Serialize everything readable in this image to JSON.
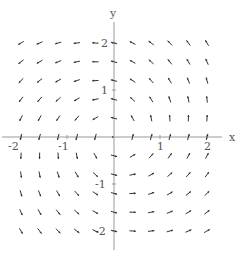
{
  "chart_data": {
    "type": "vector_field",
    "title": "",
    "xlabel": "x",
    "ylabel": "y",
    "xlim": [
      -2.45,
      2.3
    ],
    "ylim": [
      -2.35,
      2.55
    ],
    "x_ticks": [
      -2,
      -1,
      1,
      2
    ],
    "y_ticks": [
      -2,
      -1,
      1,
      2
    ],
    "x_tick_labels": [
      "-2",
      "-1",
      "1",
      "2"
    ],
    "y_tick_labels": [
      "-2",
      "-1",
      "1",
      "2"
    ],
    "grid": false,
    "legend": null,
    "field_description": "Direction field approximately F(x,y) = (x - y, x + y) rotated ~30 degrees; normalized short arrows on an 11x11 grid",
    "grid_x": [
      -2.0,
      -1.6,
      -1.2,
      -0.8,
      -0.4,
      0.0,
      0.4,
      0.8,
      1.2,
      1.6,
      2.0
    ],
    "grid_y": [
      -2.0,
      -1.6,
      -1.2,
      -0.8,
      -0.4,
      0.0,
      0.4,
      0.8,
      1.2,
      1.6,
      2.0
    ],
    "rotation_deg": 30,
    "arrow_color": "#333333",
    "axis_color": "#999999"
  },
  "axes": {
    "x_name": "x",
    "y_name": "y",
    "tick_labels": {
      "x_neg2": "-2",
      "x_neg1": "-1",
      "x_pos1": "1",
      "x_pos2": "2",
      "y_neg2": "-2",
      "y_neg1": "-1",
      "y_pos1": "1",
      "y_pos2": "2"
    }
  }
}
